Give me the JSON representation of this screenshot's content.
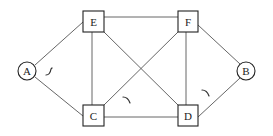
{
  "diagram": {
    "type": "network-graph",
    "nodes": [
      {
        "id": "A",
        "label": "A",
        "shape": "circle"
      },
      {
        "id": "B",
        "label": "B",
        "shape": "circle"
      },
      {
        "id": "C",
        "label": "C",
        "shape": "square"
      },
      {
        "id": "D",
        "label": "D",
        "shape": "square"
      },
      {
        "id": "E",
        "label": "E",
        "shape": "square"
      },
      {
        "id": "F",
        "label": "F",
        "shape": "square"
      }
    ],
    "edges": [
      {
        "from": "A",
        "to": "E"
      },
      {
        "from": "A",
        "to": "C"
      },
      {
        "from": "E",
        "to": "F"
      },
      {
        "from": "E",
        "to": "C"
      },
      {
        "from": "E",
        "to": "D"
      },
      {
        "from": "F",
        "to": "C"
      },
      {
        "from": "F",
        "to": "D"
      },
      {
        "from": "F",
        "to": "B"
      },
      {
        "from": "C",
        "to": "D"
      },
      {
        "from": "D",
        "to": "B"
      }
    ],
    "marks": [
      {
        "name": "curved-arrow-near-A",
        "position": "between A and E-C"
      },
      {
        "name": "curved-arrow-near-C",
        "position": "above C-D edge"
      },
      {
        "name": "curved-arrow-near-D",
        "position": "between D and B"
      }
    ]
  }
}
